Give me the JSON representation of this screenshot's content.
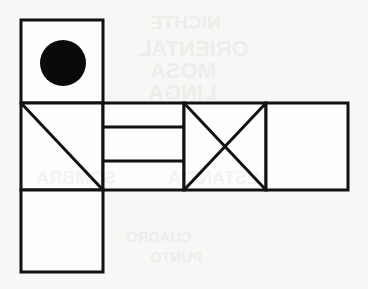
{
  "figure": {
    "canvas": {
      "width": 368,
      "height": 289,
      "background_color": "#f7f7f5",
      "stroke_color": "#111111",
      "fill_color": "#fdfdfb",
      "stroke_width": 3
    },
    "shapes": [
      {
        "name": "top-square-with-circle",
        "type": "square",
        "x": 21,
        "y": 20,
        "width": 82,
        "height": 83,
        "marking": "filled-circle"
      },
      {
        "name": "left-square-with-diagonal",
        "type": "square",
        "x": 21,
        "y": 103,
        "width": 82,
        "height": 87,
        "marking": "single-diagonal"
      },
      {
        "name": "banded-connector-rectangle",
        "type": "rectangle",
        "x": 103,
        "y": 103,
        "width": 81,
        "height": 87,
        "marking": "two-horizontal-lines"
      },
      {
        "name": "square-with-cross",
        "type": "square",
        "x": 184,
        "y": 103,
        "width": 82,
        "height": 87,
        "marking": "crossed-diagonals"
      },
      {
        "name": "right-plain-square",
        "type": "square",
        "x": 266,
        "y": 103,
        "width": 82,
        "height": 87,
        "marking": "none"
      },
      {
        "name": "bottom-plain-square",
        "type": "square",
        "x": 21,
        "y": 190,
        "width": 82,
        "height": 82,
        "marking": "none"
      }
    ],
    "circle": {
      "name": "filled-circle",
      "center_x": 63,
      "center_y": 63,
      "radius": 23,
      "fill_color": "#0a0a0a"
    },
    "diagonals": [
      {
        "name": "left-square-diagonal",
        "x1": 21,
        "y1": 103,
        "x2": 103,
        "y2": 190
      },
      {
        "name": "cross-diagonal-down",
        "x1": 184,
        "y1": 103,
        "x2": 266,
        "y2": 190
      },
      {
        "name": "cross-diagonal-up",
        "x1": 184,
        "y1": 190,
        "x2": 266,
        "y2": 103
      }
    ],
    "band_lines": [
      {
        "name": "band-line-upper",
        "x1": 103,
        "y1": 127,
        "x2": 184,
        "y2": 127
      },
      {
        "name": "band-line-lower",
        "x1": 103,
        "y1": 161,
        "x2": 184,
        "y2": 161
      }
    ],
    "bleed_through": [
      {
        "name": "bleed-line-1",
        "text": "NICHTE",
        "x": 150,
        "y": 12,
        "size": 19
      },
      {
        "name": "bleed-line-2",
        "text": "ORIENTAL",
        "x": 138,
        "y": 36,
        "size": 22
      },
      {
        "name": "bleed-line-3",
        "text": "MOSA",
        "x": 150,
        "y": 58,
        "size": 22
      },
      {
        "name": "bleed-line-4",
        "text": "LINGA",
        "x": 148,
        "y": 80,
        "size": 22
      },
      {
        "name": "bleed-line-5",
        "text": "SOMBRA",
        "x": 36,
        "y": 168,
        "size": 18
      },
      {
        "name": "bleed-line-6",
        "text": "ESTANCIA",
        "x": 168,
        "y": 168,
        "size": 18
      },
      {
        "name": "bleed-line-7",
        "text": "CUADRO",
        "x": 126,
        "y": 228,
        "size": 15
      },
      {
        "name": "bleed-line-8",
        "text": "PUNTO",
        "x": 150,
        "y": 248,
        "size": 15
      }
    ]
  }
}
